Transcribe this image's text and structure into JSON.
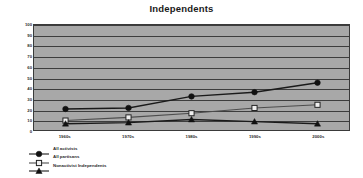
{
  "chart_data": {
    "type": "line",
    "title": "Independents",
    "xlabel": "",
    "ylabel": "Average Difference in Thermometer Scores",
    "categories": [
      "1960s",
      "1970s",
      "1980s",
      "1990s",
      "2000s"
    ],
    "ylim": [
      0,
      100
    ],
    "yticks": [
      0,
      10,
      20,
      30,
      40,
      50,
      60,
      70,
      80,
      90,
      100
    ],
    "grid": true,
    "legend_position": "bottom-left",
    "series": [
      {
        "name": "All activists",
        "marker": "filled-circle",
        "color": "#1a1a1a",
        "values": [
          20,
          21,
          32,
          36,
          45
        ]
      },
      {
        "name": "All partisans",
        "marker": "open-square",
        "color": "#4d4d4d",
        "values": [
          9,
          12,
          16,
          21,
          24
        ]
      },
      {
        "name": "Nonactivist Independents",
        "marker": "filled-triangle",
        "color": "#1a1a1a",
        "values": [
          6,
          7,
          10,
          8,
          6
        ]
      }
    ]
  },
  "colors": {
    "plot_background": "#a8a8a8",
    "gridline": "#3d3d3d",
    "axis": "#3a3a3a",
    "text": "#2b2b2b",
    "title": "#1a1a1a"
  }
}
